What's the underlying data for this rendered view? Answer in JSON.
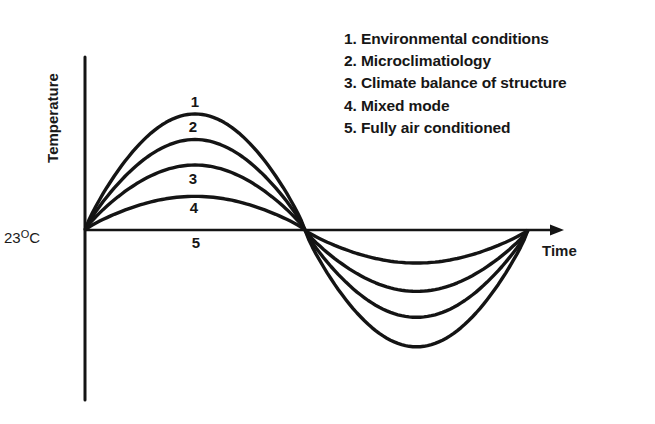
{
  "diagram": {
    "y_axis_label": "Temperature",
    "x_axis_label": "Time",
    "baseline_label": {
      "value": "23",
      "unit_sup": "O",
      "unit": "C"
    },
    "legend": [
      {
        "num": "1",
        "label": "1. Environmental conditions"
      },
      {
        "num": "2",
        "label": "2. Microclimatiology"
      },
      {
        "num": "3",
        "label": "3. Climate balance of structure"
      },
      {
        "num": "4",
        "label": "4. Mixed mode"
      },
      {
        "num": "5",
        "label": "5. Fully air conditioned"
      }
    ],
    "curve_labels": [
      {
        "text": "1",
        "x": 195,
        "y": 93
      },
      {
        "text": "2",
        "x": 193,
        "y": 118
      },
      {
        "text": "3",
        "x": 193,
        "y": 170
      },
      {
        "text": "4",
        "x": 194,
        "y": 199
      },
      {
        "text": "5",
        "x": 196,
        "y": 234
      }
    ],
    "colors": {
      "line": "#141414",
      "background": "#ffffff"
    }
  },
  "chart_data": {
    "type": "line",
    "title": "",
    "xlabel": "Time",
    "ylabel": "Temperature",
    "reference_value": "23 °C",
    "x": [
      0,
      0.25,
      0.5,
      0.75,
      1.0
    ],
    "series": [
      {
        "name": "1. Environmental conditions",
        "values": [
          0,
          1.0,
          0,
          -0.99,
          0
        ]
      },
      {
        "name": "2. Microclimatiology",
        "values": [
          0,
          0.78,
          0,
          -0.74,
          0
        ]
      },
      {
        "name": "3. Climate balance of structure",
        "values": [
          0,
          0.56,
          0,
          -0.52,
          0
        ]
      },
      {
        "name": "4. Mixed mode",
        "values": [
          0,
          0.29,
          0,
          -0.28,
          0
        ]
      },
      {
        "name": "5. Fully air conditioned",
        "values": [
          0,
          0,
          0,
          0,
          0
        ]
      }
    ],
    "grid": false,
    "legend_position": "top-right"
  }
}
